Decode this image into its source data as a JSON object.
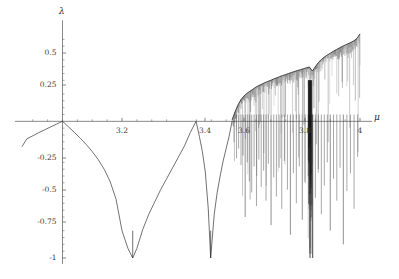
{
  "figure": {
    "title": "",
    "background_color": "#ffffff",
    "axis_color": "#555555",
    "curve_color": "#333333"
  },
  "axes": {
    "x_axis_label": "μ",
    "y_axis_label": "λ",
    "x_ticks": [
      {
        "value": 3.2,
        "label": "3.2",
        "px": 122
      },
      {
        "value": 3.4,
        "label": "3.4",
        "px": 205
      },
      {
        "value": 3.6,
        "label": "3.6",
        "px": 244
      },
      {
        "value": 3.8,
        "label": "3.8",
        "px": 305
      },
      {
        "value": 4.0,
        "label": "4",
        "px": 360
      }
    ],
    "y_ticks": [
      {
        "value": 0.5,
        "label": "0.5",
        "px": 53
      },
      {
        "value": 0.25,
        "label": "0.25",
        "px": 85
      },
      {
        "value": -0.25,
        "label": "-0.25",
        "px": 158
      },
      {
        "value": -0.5,
        "label": "-0.5",
        "px": 190
      },
      {
        "value": -0.75,
        "label": "-0.75",
        "px": 222
      },
      {
        "value": -1.0,
        "label": "-1",
        "px": 258
      }
    ]
  },
  "chart_data": {
    "type": "line",
    "title": "",
    "xlabel": "μ",
    "ylabel": "λ",
    "xlim": [
      2.88,
      4.02
    ],
    "ylim": [
      -1.0,
      0.68
    ],
    "grid": false,
    "legend": null,
    "annotations": [
      {
        "text": "period-1 to period-2 bifurcation, lambda = 0",
        "mu": 3.0,
        "lambda": 0.0
      },
      {
        "text": "superstable period-1, lambda -> -infinity",
        "mu": 3.236,
        "lambda": -1.0
      },
      {
        "text": "period-2 to period-4 bifurcation, lambda = 0",
        "mu": 3.449,
        "lambda": 0.0
      },
      {
        "text": "superstable period-4, lambda -> -infinity",
        "mu": 3.498,
        "lambda": -1.0
      },
      {
        "text": "onset of chaos (Feigenbaum point)",
        "mu": 3.5699,
        "lambda": 0.0
      },
      {
        "text": "period-3 window",
        "mu": 3.832,
        "lambda": -1.0
      },
      {
        "text": "fully chaotic endpoint",
        "mu": 4.0,
        "lambda": 0.693
      }
    ],
    "series": [
      {
        "name": "lyapunov-exponent",
        "color": "#333333",
        "x": [
          2.88,
          2.9,
          2.92,
          2.94,
          2.96,
          2.98,
          3.0,
          3.02,
          3.04,
          3.06,
          3.08,
          3.1,
          3.12,
          3.14,
          3.16,
          3.18,
          3.2,
          3.22,
          3.236,
          3.25,
          3.27,
          3.29,
          3.31,
          3.33,
          3.35,
          3.37,
          3.39,
          3.41,
          3.43,
          3.449,
          3.46,
          3.47,
          3.48,
          3.49,
          3.498,
          3.51,
          3.52,
          3.53,
          3.54,
          3.55,
          3.56,
          3.5699
        ],
        "y": [
          -0.128,
          -0.106,
          -0.083,
          -0.062,
          -0.041,
          -0.02,
          0.0,
          -0.04,
          -0.081,
          -0.124,
          -0.17,
          -0.221,
          -0.28,
          -0.35,
          -0.44,
          -0.57,
          -0.8,
          -0.93,
          -1.0,
          -0.93,
          -0.79,
          -0.68,
          -0.59,
          -0.5,
          -0.42,
          -0.34,
          -0.26,
          -0.18,
          -0.08,
          0.0,
          -0.11,
          -0.22,
          -0.37,
          -0.64,
          -1.0,
          -0.68,
          -0.52,
          -0.4,
          -0.29,
          -0.2,
          -0.11,
          0.0
        ]
      },
      {
        "name": "chaotic-band-upper-envelope",
        "color": "#222222",
        "x": [
          3.57,
          3.58,
          3.59,
          3.6,
          3.61,
          3.62,
          3.63,
          3.64,
          3.65,
          3.66,
          3.67,
          3.68,
          3.69,
          3.7,
          3.71,
          3.72,
          3.73,
          3.74,
          3.75,
          3.76,
          3.77,
          3.78,
          3.79,
          3.8,
          3.81,
          3.82,
          3.83,
          3.84,
          3.85,
          3.86,
          3.87,
          3.88,
          3.89,
          3.9,
          3.91,
          3.92,
          3.93,
          3.94,
          3.95,
          3.96,
          3.97,
          3.98,
          3.99,
          4.0
        ],
        "y": [
          0.01,
          0.07,
          0.12,
          0.16,
          0.185,
          0.205,
          0.22,
          0.235,
          0.25,
          0.262,
          0.272,
          0.283,
          0.292,
          0.3,
          0.31,
          0.318,
          0.327,
          0.335,
          0.342,
          0.35,
          0.358,
          0.365,
          0.372,
          0.378,
          0.385,
          0.392,
          0.398,
          0.368,
          0.4,
          0.43,
          0.452,
          0.47,
          0.485,
          0.498,
          0.512,
          0.524,
          0.536,
          0.548,
          0.558,
          0.568,
          0.578,
          0.59,
          0.606,
          0.64
        ]
      }
    ],
    "periodic_window_spikes": [
      {
        "mu": 3.585,
        "depth": -0.27
      },
      {
        "mu": 3.592,
        "depth": -0.2
      },
      {
        "mu": 3.6,
        "depth": -0.32
      },
      {
        "mu": 3.607,
        "depth": -0.25
      },
      {
        "mu": 3.614,
        "depth": -0.7
      },
      {
        "mu": 3.621,
        "depth": -0.3
      },
      {
        "mu": 3.628,
        "depth": -0.44
      },
      {
        "mu": 3.636,
        "depth": -0.52
      },
      {
        "mu": 3.644,
        "depth": -0.33
      },
      {
        "mu": 3.652,
        "depth": -0.62
      },
      {
        "mu": 3.66,
        "depth": -0.28
      },
      {
        "mu": 3.668,
        "depth": -0.48
      },
      {
        "mu": 3.676,
        "depth": -0.36
      },
      {
        "mu": 3.684,
        "depth": -0.58
      },
      {
        "mu": 3.692,
        "depth": -0.31
      },
      {
        "mu": 3.701,
        "depth": -0.76
      },
      {
        "mu": 3.71,
        "depth": -0.41
      },
      {
        "mu": 3.719,
        "depth": -0.55
      },
      {
        "mu": 3.728,
        "depth": -0.34
      },
      {
        "mu": 3.737,
        "depth": -0.64
      },
      {
        "mu": 3.746,
        "depth": -0.29
      },
      {
        "mu": 3.756,
        "depth": -0.5
      },
      {
        "mu": 3.766,
        "depth": -0.83
      },
      {
        "mu": 3.776,
        "depth": -0.38
      },
      {
        "mu": 3.786,
        "depth": -0.6
      },
      {
        "mu": 3.796,
        "depth": -0.33
      },
      {
        "mu": 3.806,
        "depth": -0.72
      },
      {
        "mu": 3.816,
        "depth": -0.45
      },
      {
        "mu": 3.826,
        "depth": -0.4
      },
      {
        "mu": 3.832,
        "depth": -1.0
      },
      {
        "mu": 3.841,
        "depth": -1.0
      },
      {
        "mu": 3.85,
        "depth": -0.56
      },
      {
        "mu": 3.86,
        "depth": -0.35
      },
      {
        "mu": 3.87,
        "depth": -0.68
      },
      {
        "mu": 3.88,
        "depth": -0.47
      },
      {
        "mu": 3.89,
        "depth": -0.3
      },
      {
        "mu": 3.9,
        "depth": -0.8
      },
      {
        "mu": 3.911,
        "depth": -0.42
      },
      {
        "mu": 3.922,
        "depth": -0.58
      },
      {
        "mu": 3.933,
        "depth": -0.34
      },
      {
        "mu": 3.944,
        "depth": -0.9
      },
      {
        "mu": 3.956,
        "depth": -0.51
      },
      {
        "mu": 3.968,
        "depth": -0.38
      },
      {
        "mu": 3.98,
        "depth": -0.64
      },
      {
        "mu": 3.992,
        "depth": -0.26
      }
    ]
  }
}
